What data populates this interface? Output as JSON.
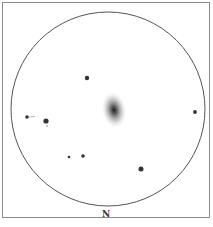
{
  "sketch": {
    "orientation_label": "N",
    "field_circle": {
      "cx": 108,
      "cy": 109,
      "r": 97,
      "stroke": "#555555"
    },
    "galaxy": {
      "cx": 114,
      "cy": 110,
      "rx": 11,
      "ry": 17,
      "core_color": "#2a2a2a"
    },
    "stars": [
      {
        "x": 87,
        "y": 78,
        "r": 2.2
      },
      {
        "x": 27,
        "y": 117,
        "r": 1.8
      },
      {
        "x": 46,
        "y": 121,
        "r": 2.6
      },
      {
        "x": 47,
        "y": 126,
        "r": 0.8
      },
      {
        "x": 195,
        "y": 112,
        "r": 1.9
      },
      {
        "x": 83,
        "y": 156,
        "r": 1.8
      },
      {
        "x": 69,
        "y": 157,
        "r": 1.3
      },
      {
        "x": 141,
        "y": 169,
        "r": 2.5
      }
    ]
  }
}
